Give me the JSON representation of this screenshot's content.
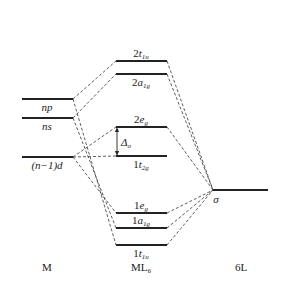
{
  "diagram": {
    "type": "molecular-orbital-diagram",
    "columns": {
      "left": {
        "label": "M",
        "x1": 22,
        "x2": 73
      },
      "middle": {
        "label_main": "ML",
        "label_sub": "6",
        "x1": 116,
        "x2": 167
      },
      "right": {
        "label": "6L",
        "x1": 213,
        "x2": 268
      }
    },
    "metal_levels": [
      {
        "id": "np",
        "label": "np",
        "y": 99
      },
      {
        "id": "ns",
        "label": "ns",
        "y": 118
      },
      {
        "id": "d",
        "label": "(n−1)d",
        "y": 157
      }
    ],
    "mo_levels": [
      {
        "id": "2t1u",
        "num": "2",
        "sym": "t",
        "sub": "1u",
        "y": 61
      },
      {
        "id": "2a1g",
        "num": "2",
        "sym": "a",
        "sub": "1g",
        "y": 74
      },
      {
        "id": "2eg",
        "num": "2",
        "sym": "e",
        "sub": "g",
        "y": 127
      },
      {
        "id": "1t2g",
        "num": "1",
        "sym": "t",
        "sub": "2g",
        "y": 156
      },
      {
        "id": "1eg",
        "num": "1",
        "sym": "e",
        "sub": "g",
        "y": 213
      },
      {
        "id": "1a1g",
        "num": "1",
        "sym": "a",
        "sub": "1g",
        "y": 228
      },
      {
        "id": "1t1u",
        "num": "1",
        "sym": "t",
        "sub": "1u",
        "y": 245
      }
    ],
    "ligand_level": {
      "label": "σ",
      "y": 190
    },
    "splitting": {
      "label": "Δ",
      "sub": "o"
    }
  }
}
